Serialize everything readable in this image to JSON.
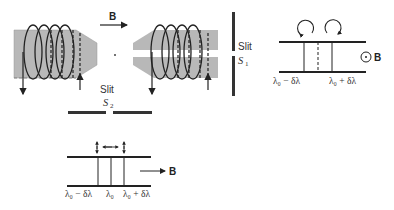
{
  "diagram": {
    "magnet": {
      "field_label": "B",
      "slit_s1_label": "Slit",
      "slit_s1_symbol": "S",
      "slit_s1_subscript": "1",
      "slit_s2_label": "Slit",
      "slit_s2_symbol": "S",
      "slit_s2_subscript": "2"
    },
    "transverse_view": {
      "field_label": "B",
      "field_symbol": "⊙",
      "left_label": "λ₀ − δλ",
      "right_label": "λ₀ + δλ"
    },
    "longitudinal_view": {
      "field_label": "B",
      "left_label": "λ₀ − δλ",
      "center_label": "λ₀",
      "right_label": "λ₀ + δλ"
    },
    "colors": {
      "pole_fill": "#b8b8b8",
      "line": "#222222",
      "background": "#ffffff"
    }
  }
}
